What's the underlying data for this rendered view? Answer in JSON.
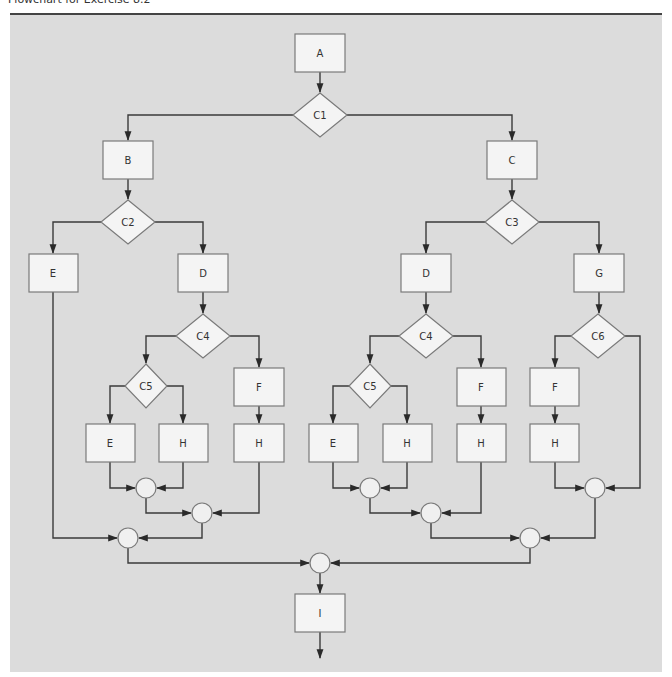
{
  "caption": "Flowchart for Exercise 8.2",
  "colors": {
    "panel": "#dcdcdc",
    "node_fill": "#f4f4f4",
    "node_stroke": "#7a7a7a",
    "edge": "#3a3a3a",
    "rule": "#444444"
  },
  "nodes": {
    "A": "A",
    "C1": "C1",
    "B": "B",
    "C": "C",
    "C2": "C2",
    "C3": "C3",
    "E_left": "E",
    "D_left": "D",
    "D_mid": "D",
    "G": "G",
    "C4_left": "C4",
    "C4_mid": "C4",
    "C6": "C6",
    "C5_left": "C5",
    "C5_mid": "C5",
    "F_left": "F",
    "F_mid": "F",
    "F_right": "F",
    "E_left2": "E",
    "H_left1": "H",
    "H_left2": "H",
    "E_mid": "E",
    "H_mid1": "H",
    "H_mid2": "H",
    "H_right": "H",
    "I": "I"
  },
  "edges": [
    [
      "A",
      "C1"
    ],
    [
      "C1",
      "B"
    ],
    [
      "C1",
      "C"
    ],
    [
      "B",
      "C2"
    ],
    [
      "C",
      "C3"
    ],
    [
      "C2",
      "E_left"
    ],
    [
      "C2",
      "D_left"
    ],
    [
      "C3",
      "D_mid"
    ],
    [
      "C3",
      "G"
    ],
    [
      "D_left",
      "C4_left"
    ],
    [
      "D_mid",
      "C4_mid"
    ],
    [
      "G",
      "C6"
    ],
    [
      "C4_left",
      "C5_left"
    ],
    [
      "C4_left",
      "F_left"
    ],
    [
      "C4_mid",
      "C5_mid"
    ],
    [
      "C4_mid",
      "F_mid"
    ],
    [
      "C6",
      "F_right"
    ],
    [
      "C6",
      "J_r1"
    ],
    [
      "C5_left",
      "E_left2"
    ],
    [
      "C5_left",
      "H_left1"
    ],
    [
      "F_left",
      "H_left2"
    ],
    [
      "C5_mid",
      "E_mid"
    ],
    [
      "C5_mid",
      "H_mid1"
    ],
    [
      "F_mid",
      "H_mid2"
    ],
    [
      "F_right",
      "H_right"
    ],
    [
      "E_left2",
      "J_l1"
    ],
    [
      "H_left1",
      "J_l1"
    ],
    [
      "J_l1",
      "J_l2"
    ],
    [
      "H_left2",
      "J_l2"
    ],
    [
      "E_left",
      "J_l3"
    ],
    [
      "J_l2",
      "J_l3"
    ],
    [
      "E_mid",
      "J_m1"
    ],
    [
      "H_mid1",
      "J_m1"
    ],
    [
      "J_m1",
      "J_m2"
    ],
    [
      "H_mid2",
      "J_m2"
    ],
    [
      "H_right",
      "J_r1"
    ],
    [
      "J_m2",
      "J_r2"
    ],
    [
      "J_r1",
      "J_r2"
    ],
    [
      "J_l3",
      "J_final"
    ],
    [
      "J_r2",
      "J_final"
    ],
    [
      "J_final",
      "I"
    ],
    [
      "I",
      "exit"
    ]
  ]
}
